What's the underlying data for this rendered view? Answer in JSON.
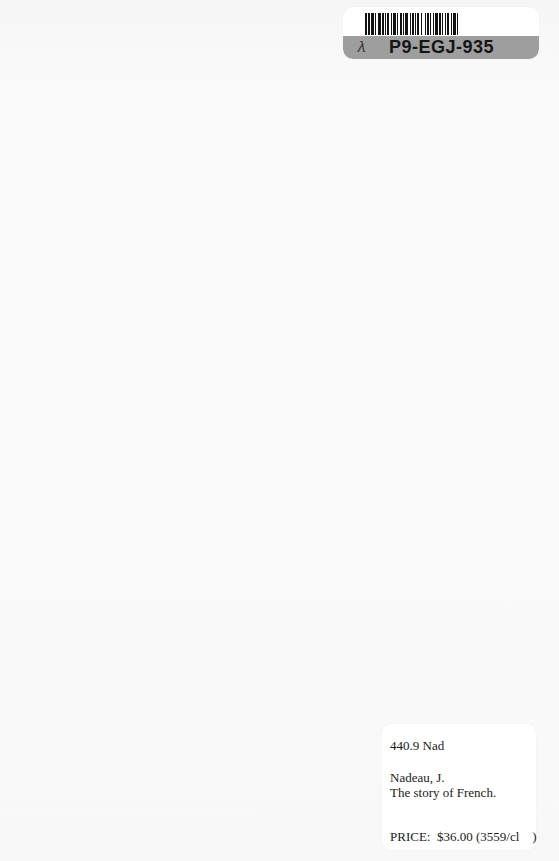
{
  "page": {
    "background_color": "#fafafa"
  },
  "barcode_sticker": {
    "barcode_id": "P9-EGJ-935",
    "handwritten_mark": "❁",
    "band_color": "#9e9e9e",
    "bars": [
      2,
      1,
      2,
      1,
      3,
      1,
      1,
      2,
      3,
      1,
      2,
      1,
      1,
      1,
      2,
      2,
      1,
      1,
      3,
      1,
      1,
      2,
      2,
      1,
      1,
      1,
      3,
      2,
      1,
      1,
      2,
      1,
      1,
      1,
      2,
      2,
      1,
      3,
      1,
      1,
      2,
      1,
      1,
      2,
      1,
      1,
      3,
      1,
      2,
      1,
      1,
      2,
      1,
      1,
      2,
      2,
      1,
      1,
      3,
      1,
      1,
      2
    ]
  },
  "label_card": {
    "call_number": "440.9 Nad",
    "author": "Nadeau, J.",
    "title": "The story of French.",
    "price_line": "PRICE:  $36.00 (3559/cl    )"
  }
}
